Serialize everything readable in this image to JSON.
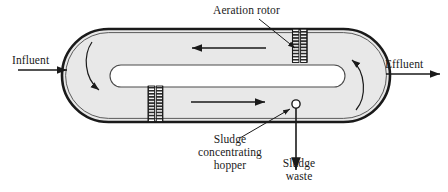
{
  "figure": {
    "type": "process-flow-diagram"
  },
  "labels": {
    "aeration_rotor": "Aeration rotor",
    "influent": "Influent",
    "effluent": "Effluent",
    "sludge_concentrating_hopper": "Sludge\nconcentrating\nhopper",
    "sludge_waste": "Sludge\nwaste"
  },
  "colors": {
    "stroke": "#1a1a1a",
    "tank_fill": "#e8e8e8",
    "baffle_fill": "#ffffff",
    "rotor_fill": "#3a3a3a",
    "background": "#ffffff"
  },
  "components": {
    "tank": {
      "shape": "stadium",
      "x": 62,
      "y": 29,
      "width": 328,
      "height": 93
    },
    "inner_baffle": {
      "shape": "stadium",
      "x": 110,
      "y": 65,
      "width": 235,
      "height": 22
    },
    "rotor_upper_right": {
      "x": 292,
      "y": 29,
      "width": 15,
      "height": 33
    },
    "rotor_lower_left": {
      "x": 148,
      "y": 86,
      "width": 15,
      "height": 36
    },
    "hopper_circle": {
      "cx": 296,
      "cy": 104,
      "r": 4
    }
  },
  "flow": {
    "influent_direction": "right",
    "effluent_direction": "right",
    "upper_channel_direction": "left",
    "lower_channel_direction": "right",
    "left_end_turn": "downward",
    "right_end_turn": "upward",
    "sludge_waste_direction": "down"
  }
}
